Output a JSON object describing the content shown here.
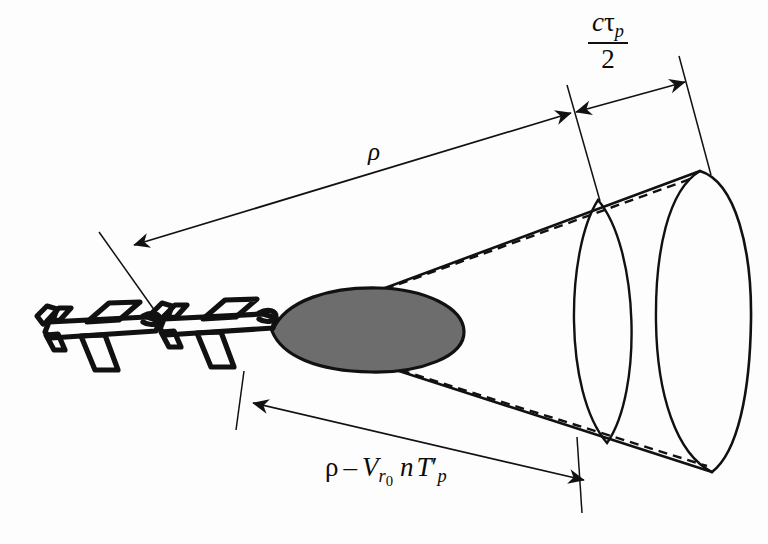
{
  "figure": {
    "background_color": "#fdfdfd",
    "ink_color": "#111111",
    "lobe_fill_color": "#6d6d6d"
  },
  "labels": {
    "range": {
      "text": "ρ",
      "name": "range-rho-label",
      "x": 368,
      "y": 138
    },
    "pulse_length": {
      "numerator_c": "c",
      "numerator_tau": "τ",
      "numerator_tau_sub": "p",
      "denominator": "2",
      "name": "pulse-length-label",
      "x": 588,
      "y": 12
    },
    "displaced_range": {
      "rho": "ρ",
      "minus": "–",
      "v": "V",
      "v_sub": "r",
      "v_subsub": "0",
      "n": "n",
      "t": "T",
      "t_prime": "′",
      "t_sub": "p",
      "name": "displaced-range-label",
      "x": 325,
      "y": 455
    }
  },
  "geometry": {
    "apex": {
      "x": 272,
      "y": 330
    },
    "cone": {
      "upper_edge": {
        "x1": 272,
        "y1": 330,
        "x2": 700,
        "y2": 171
      },
      "lower_edge": {
        "x1": 272,
        "y1": 330,
        "x2": 712,
        "y2": 472
      },
      "dashed_upper": {
        "x1": 272,
        "y1": 330,
        "x2": 690,
        "y2": 180
      },
      "dashed_lower": {
        "x1": 272,
        "y1": 330,
        "x2": 705,
        "y2": 464
      },
      "cap_outer": "M700,171 C736,182 752,250 751,320 C750,392 738,452 712,472",
      "cap_front": "M700,171 C668,190 655,252 656,322 C657,394 676,454 712,472",
      "inner_ellipse_top": {
        "x": 598,
        "y": 200
      },
      "inner_ellipse_bottom": {
        "x": 607,
        "y": 443
      },
      "inner_ellipse_left_bulge": 32,
      "inner_ellipse_right_bulge": 30
    },
    "lobe": {
      "path": "M272,331 C284,300 330,288 376,289 C424,290 462,308 463,331 C464,356 420,372 372,371 C318,370 282,355 272,331"
    },
    "dimension_range": {
      "from": {
        "x": 133,
        "y": 245
      },
      "to": {
        "x": 571,
        "y": 113
      },
      "ext_left": {
        "x1": 97,
        "y1": 231,
        "x2": 160,
        "y2": 318
      },
      "ext_right": {
        "x1": 567,
        "y1": 84,
        "x2": 600,
        "y2": 200
      }
    },
    "dimension_pulse": {
      "from": {
        "x": 574,
        "y": 113
      },
      "to": {
        "x": 684,
        "y": 82
      },
      "ext_right": {
        "x1": 679,
        "y1": 55,
        "x2": 712,
        "y2": 175
      }
    },
    "dimension_displaced": {
      "from": {
        "x": 252,
        "y": 403
      },
      "to": {
        "x": 585,
        "y": 480
      },
      "ext_left": {
        "x1": 243,
        "y1": 371,
        "x2": 236,
        "y2": 430
      },
      "ext_right": {
        "x1": 577,
        "y1": 437,
        "x2": 582,
        "y2": 513
      }
    },
    "aircraft": [
      {
        "name": "aircraft-ghost-rear",
        "x": 35,
        "y": 300,
        "scale": 1.0
      },
      {
        "name": "aircraft-lead-front",
        "x": 150,
        "y": 297,
        "scale": 1.02
      }
    ]
  }
}
